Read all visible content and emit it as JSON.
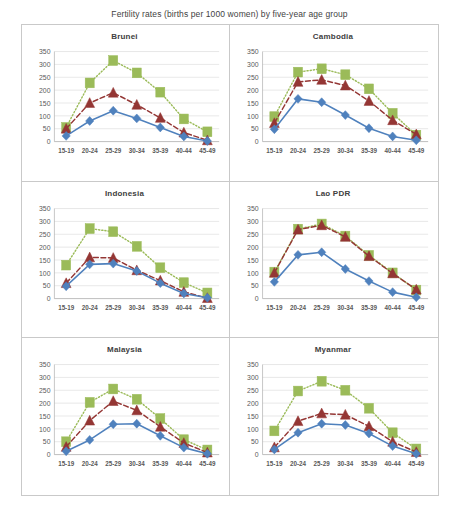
{
  "figure": {
    "title": "Fertility rates (births per 1000 women) by five-year age group"
  },
  "axis": {
    "y_ticks": [
      "350",
      "300",
      "250",
      "200",
      "150",
      "100",
      "50",
      "0"
    ],
    "x_ticks": [
      "15-19",
      "20-24",
      "25-29",
      "30-34",
      "35-39",
      "40-44",
      "45-49"
    ]
  },
  "colors": {
    "series_blue": "#4F81BD",
    "series_red": "#943634",
    "series_green": "#9BBB59",
    "gridline": "#d9d9d9",
    "panel_border": "#c9c9c9",
    "text": "#4a4a4a"
  },
  "panels": [
    {
      "name": "Brunei"
    },
    {
      "name": "Cambodia"
    },
    {
      "name": "Indonesia"
    },
    {
      "name": "Lao PDR"
    },
    {
      "name": "Malaysia"
    },
    {
      "name": "Myanmar"
    }
  ],
  "chart_data": [
    {
      "type": "line",
      "title": "Brunei",
      "xlabel": "",
      "ylabel": "",
      "ylim": [
        0,
        350
      ],
      "grid": true,
      "legend": "none",
      "categories": [
        "15-19",
        "20-24",
        "25-29",
        "30-34",
        "35-39",
        "40-44",
        "45-49"
      ],
      "series": [
        {
          "name": "blue-diamond-series",
          "marker": "diamond",
          "line": "solid",
          "color": "#4F81BD",
          "values": [
            22,
            80,
            120,
            90,
            55,
            20,
            2
          ]
        },
        {
          "name": "red-triangle-series",
          "marker": "triangle",
          "line": "dashed",
          "color": "#943634",
          "values": [
            50,
            150,
            190,
            143,
            92,
            35,
            5
          ]
        },
        {
          "name": "green-square-series",
          "marker": "square",
          "line": "dotted",
          "color": "#9BBB59",
          "values": [
            55,
            228,
            315,
            267,
            192,
            88,
            38
          ]
        }
      ]
    },
    {
      "type": "line",
      "title": "Cambodia",
      "xlabel": "",
      "ylabel": "",
      "ylim": [
        0,
        350
      ],
      "grid": true,
      "legend": "none",
      "categories": [
        "15-19",
        "20-24",
        "25-29",
        "30-34",
        "35-39",
        "40-44",
        "45-49"
      ],
      "series": [
        {
          "name": "blue-diamond-series",
          "marker": "diamond",
          "line": "solid",
          "color": "#4F81BD",
          "values": [
            48,
            166,
            153,
            103,
            52,
            20,
            5
          ]
        },
        {
          "name": "red-triangle-series",
          "marker": "triangle",
          "line": "dashed",
          "color": "#943634",
          "values": [
            72,
            232,
            240,
            218,
            158,
            83,
            28
          ]
        },
        {
          "name": "green-square-series",
          "marker": "square",
          "line": "dotted",
          "color": "#9BBB59",
          "values": [
            97,
            270,
            283,
            260,
            205,
            110,
            25
          ]
        }
      ]
    },
    {
      "type": "line",
      "title": "Indonesia",
      "xlabel": "",
      "ylabel": "",
      "ylim": [
        0,
        350
      ],
      "grid": true,
      "legend": "none",
      "categories": [
        "15-19",
        "20-24",
        "25-29",
        "30-34",
        "35-39",
        "40-44",
        "45-49"
      ],
      "series": [
        {
          "name": "blue-diamond-series",
          "marker": "diamond",
          "line": "solid",
          "color": "#4F81BD",
          "values": [
            48,
            133,
            136,
            107,
            60,
            20,
            3
          ]
        },
        {
          "name": "red-triangle-series",
          "marker": "triangle",
          "line": "dashed",
          "color": "#943634",
          "values": [
            60,
            160,
            158,
            110,
            70,
            26,
            2
          ]
        },
        {
          "name": "green-square-series",
          "marker": "square",
          "line": "dotted",
          "color": "#9BBB59",
          "values": [
            130,
            272,
            260,
            203,
            120,
            62,
            22
          ]
        }
      ]
    },
    {
      "type": "line",
      "title": "Lao PDR",
      "xlabel": "",
      "ylabel": "",
      "ylim": [
        0,
        350
      ],
      "grid": true,
      "legend": "none",
      "categories": [
        "15-19",
        "20-24",
        "25-29",
        "30-34",
        "35-39",
        "40-44",
        "45-49"
      ],
      "series": [
        {
          "name": "blue-diamond-series",
          "marker": "diamond",
          "line": "solid",
          "color": "#4F81BD",
          "values": [
            65,
            170,
            180,
            115,
            68,
            25,
            5
          ]
        },
        {
          "name": "red-triangle-series",
          "marker": "triangle",
          "line": "dashed",
          "color": "#943634",
          "values": [
            100,
            268,
            285,
            240,
            165,
            98,
            35
          ]
        },
        {
          "name": "green-square-series",
          "marker": "square",
          "line": "dotted",
          "color": "#9BBB59",
          "values": [
            103,
            270,
            290,
            243,
            168,
            100,
            33
          ]
        }
      ]
    },
    {
      "type": "line",
      "title": "Malaysia",
      "xlabel": "",
      "ylabel": "",
      "ylim": [
        0,
        350
      ],
      "grid": true,
      "legend": "none",
      "categories": [
        "15-19",
        "20-24",
        "25-29",
        "30-34",
        "35-39",
        "40-44",
        "45-49"
      ],
      "series": [
        {
          "name": "blue-diamond-series",
          "marker": "diamond",
          "line": "solid",
          "color": "#4F81BD",
          "values": [
            13,
            57,
            118,
            120,
            73,
            27,
            3
          ]
        },
        {
          "name": "red-triangle-series",
          "marker": "triangle",
          "line": "dashed",
          "color": "#943634",
          "values": [
            30,
            132,
            208,
            172,
            108,
            45,
            8
          ]
        },
        {
          "name": "green-square-series",
          "marker": "square",
          "line": "dotted",
          "color": "#9BBB59",
          "values": [
            50,
            203,
            255,
            215,
            140,
            58,
            18
          ]
        }
      ]
    },
    {
      "type": "line",
      "title": "Myanmar",
      "xlabel": "",
      "ylabel": "",
      "ylim": [
        0,
        350
      ],
      "grid": true,
      "legend": "none",
      "categories": [
        "15-19",
        "20-24",
        "25-29",
        "30-34",
        "35-39",
        "40-44",
        "45-49"
      ],
      "series": [
        {
          "name": "blue-diamond-series",
          "marker": "diamond",
          "line": "solid",
          "color": "#4F81BD",
          "values": [
            20,
            85,
            120,
            115,
            82,
            33,
            3
          ]
        },
        {
          "name": "red-triangle-series",
          "marker": "triangle",
          "line": "dashed",
          "color": "#943634",
          "values": [
            28,
            130,
            160,
            155,
            110,
            50,
            10
          ]
        },
        {
          "name": "green-square-series",
          "marker": "square",
          "line": "dotted",
          "color": "#9BBB59",
          "values": [
            92,
            247,
            285,
            250,
            180,
            85,
            22
          ]
        }
      ]
    }
  ]
}
